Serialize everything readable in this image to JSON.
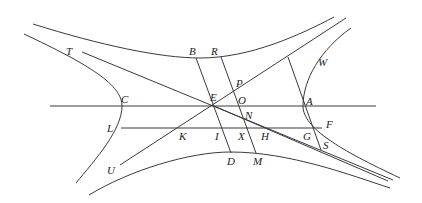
{
  "diagram": {
    "type": "conjugate-hyperbolas-geometry",
    "stroke_color": "#3a3a3a",
    "label_color": "#222222",
    "labels": [
      {
        "id": "T",
        "text": "T",
        "x": 66,
        "y": 55
      },
      {
        "id": "B",
        "text": "B",
        "x": 189,
        "y": 55
      },
      {
        "id": "R",
        "text": "R",
        "x": 211,
        "y": 55
      },
      {
        "id": "W",
        "text": "W",
        "x": 318,
        "y": 66
      },
      {
        "id": "P",
        "text": "P",
        "x": 236,
        "y": 87
      },
      {
        "id": "E",
        "text": "E",
        "x": 210,
        "y": 101
      },
      {
        "id": "O",
        "text": "O",
        "x": 238,
        "y": 104
      },
      {
        "id": "C",
        "text": "C",
        "x": 121,
        "y": 103
      },
      {
        "id": "A",
        "text": "A",
        "x": 306,
        "y": 105
      },
      {
        "id": "N",
        "text": "N",
        "x": 245,
        "y": 119
      },
      {
        "id": "F",
        "text": "F",
        "x": 326,
        "y": 128
      },
      {
        "id": "L",
        "text": "L",
        "x": 107,
        "y": 132
      },
      {
        "id": "K",
        "text": "K",
        "x": 179,
        "y": 140
      },
      {
        "id": "I",
        "text": "I",
        "x": 215,
        "y": 140
      },
      {
        "id": "X",
        "text": "X",
        "x": 238,
        "y": 140
      },
      {
        "id": "H",
        "text": "H",
        "x": 261,
        "y": 140
      },
      {
        "id": "G",
        "text": "G",
        "x": 303,
        "y": 140
      },
      {
        "id": "S",
        "text": "S",
        "x": 323,
        "y": 149
      },
      {
        "id": "U",
        "text": "U",
        "x": 107,
        "y": 174
      },
      {
        "id": "D",
        "text": "D",
        "x": 227,
        "y": 165
      },
      {
        "id": "M",
        "text": "M",
        "x": 253,
        "y": 165
      }
    ],
    "curves": [
      {
        "id": "upper-conjugate-branch",
        "d": "M33,24 C100,45 160,58 200,58 C250,58 300,35 334,17"
      },
      {
        "id": "lower-conjugate-branch",
        "d": "M89,195 C130,170 190,152 230,152 C290,152 350,175 390,188"
      },
      {
        "id": "left-hyperbola-branch",
        "d": "M24,34 C90,65 122,85 122,106 C122,130 95,160 76,183"
      },
      {
        "id": "right-hyperbola-branch",
        "d": "M351,28 C320,50 303,80 303,106 C303,128 340,150 400,178"
      }
    ],
    "lines": [
      {
        "id": "transverse-axis-C-A",
        "x1": 50,
        "y1": 106,
        "x2": 376,
        "y2": 106
      },
      {
        "id": "ordinate-L-F",
        "x1": 121,
        "y1": 128,
        "x2": 322,
        "y2": 128
      },
      {
        "id": "asymptote-T-E",
        "x1": 82,
        "y1": 52,
        "x2": 393,
        "y2": 180
      },
      {
        "id": "asymptote-U-W",
        "x1": 120,
        "y1": 165,
        "x2": 346,
        "y2": 18
      },
      {
        "id": "line-B-D",
        "x1": 196,
        "y1": 58,
        "x2": 231,
        "y2": 153
      },
      {
        "id": "line-R-M",
        "x1": 221,
        "y1": 57,
        "x2": 256,
        "y2": 153
      },
      {
        "id": "line-W-S",
        "x1": 288,
        "y1": 57,
        "x2": 321,
        "y2": 150
      },
      {
        "id": "line-E-S",
        "x1": 214,
        "y1": 106,
        "x2": 388,
        "y2": 181
      }
    ]
  }
}
